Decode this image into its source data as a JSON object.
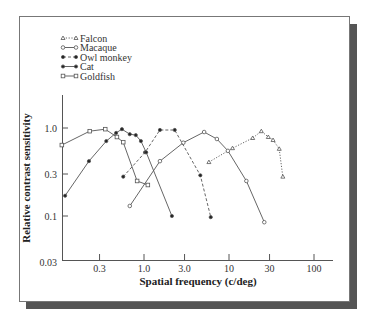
{
  "chart_data": {
    "type": "line",
    "title": "",
    "xlabel": "Spatial frequency (c/deg)",
    "ylabel": "Relative contrast sensitivity",
    "xscale": "log",
    "yscale": "log",
    "xlim": [
      0.11,
      170
    ],
    "ylim": [
      0.03,
      2.0
    ],
    "xticks": [
      0.3,
      1.0,
      3.0,
      10,
      30,
      100
    ],
    "xtick_labels": [
      "0.3",
      "1.0",
      "3.0",
      "10",
      "30",
      "100"
    ],
    "yticks": [
      0.03,
      0.1,
      0.3,
      1.0
    ],
    "ytick_labels": [
      "0.03",
      "0.1",
      "0.3",
      "1.0"
    ],
    "grid": false,
    "legend_position": "top-left",
    "series": [
      {
        "name": "Falcon",
        "marker": "triangle",
        "line": "dotted",
        "x": [
          5.8,
          11,
          19,
          24,
          29,
          33,
          39,
          43
        ],
        "y": [
          0.41,
          0.59,
          0.77,
          0.92,
          0.79,
          0.73,
          0.58,
          0.28
        ]
      },
      {
        "name": "Macaque",
        "marker": "open-circle",
        "line": "solid",
        "x": [
          0.68,
          1.54,
          2.9,
          5.1,
          7.2,
          9.7,
          16,
          26
        ],
        "y": [
          0.13,
          0.42,
          0.68,
          0.9,
          0.75,
          0.55,
          0.25,
          0.085
        ]
      },
      {
        "name": "Owl monkey",
        "marker": "filled-circle",
        "line": "dashed",
        "x": [
          0.57,
          1.03,
          1.54,
          2.3,
          4.6,
          6.1
        ],
        "y": [
          0.28,
          0.53,
          0.95,
          0.95,
          0.29,
          0.097
        ]
      },
      {
        "name": "Cat",
        "marker": "filled-circle",
        "line": "solid",
        "x": [
          0.118,
          0.225,
          0.36,
          0.47,
          0.55,
          0.68,
          0.8,
          0.92,
          1.06,
          2.13
        ],
        "y": [
          0.17,
          0.42,
          0.71,
          0.88,
          0.97,
          0.85,
          0.83,
          0.71,
          0.53,
          0.1
        ]
      },
      {
        "name": "Goldfish",
        "marker": "open-square",
        "line": "solid",
        "x": [
          0.108,
          0.23,
          0.35,
          0.48,
          0.57,
          0.83,
          1.11
        ],
        "y": [
          0.64,
          0.92,
          0.97,
          0.79,
          0.69,
          0.25,
          0.225
        ]
      }
    ]
  },
  "legend": {
    "items": [
      {
        "label": "Falcon"
      },
      {
        "label": "Macaque"
      },
      {
        "label": "Owl monkey"
      },
      {
        "label": "Cat"
      },
      {
        "label": "Goldfish"
      }
    ]
  },
  "axes": {
    "xlabel": "Spatial frequency (c/deg)",
    "ylabel": "Relative contrast sensitivity",
    "xtick_labels": [
      "0.3",
      "1.0",
      "3.0",
      "10",
      "30",
      "100"
    ],
    "ytick_labels": [
      "0.03",
      "0.1",
      "0.3",
      "1.0"
    ]
  },
  "colors": {
    "frame": "#555555",
    "shadow": "#555555",
    "axis": "#555555",
    "series_line": "#555555",
    "text": "#333333"
  }
}
